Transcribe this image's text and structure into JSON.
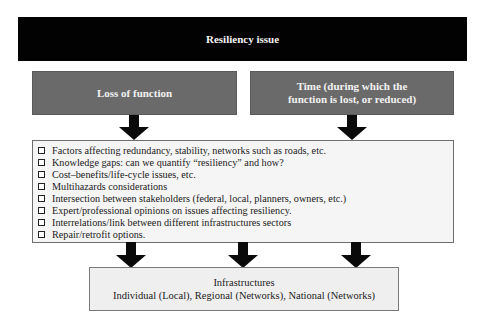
{
  "diagram": {
    "top": {
      "label": "Resiliency issue"
    },
    "branches": [
      {
        "label": "Loss of function"
      },
      {
        "label": "Time (during which the function is lost, or reduced)"
      }
    ],
    "considerations": [
      {
        "label": "Factors affecting redundancy, stability, networks such as roads, etc."
      },
      {
        "label": "Knowledge gaps: can we quantify “resiliency” and how?"
      },
      {
        "label": "Cost–benefits/life-cycle issues, etc."
      },
      {
        "label": "Multihazards considerations"
      },
      {
        "label": "Intersection between stakeholders (federal, local, planners, owners, etc.)"
      },
      {
        "label": "Expert/professional opinions on issues affecting resiliency."
      },
      {
        "label": "Interrelations/link between different infrastructures sectors"
      },
      {
        "label": "Repair/retrofit options."
      }
    ],
    "bottom": {
      "title": "Infrastructures",
      "subtitle": "Individual (Local), Regional (Networks), National (Networks)"
    },
    "colors": {
      "top_box": "#020202",
      "branch_box": "#6a6a6a",
      "list_box": "#f5f5f5",
      "bottom_box": "#efefef",
      "arrow": "#0a0a0a"
    }
  }
}
